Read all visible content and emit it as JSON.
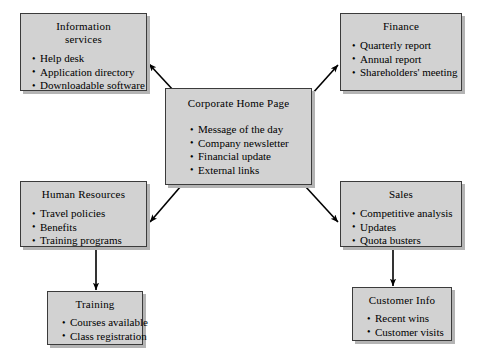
{
  "diagram": {
    "style": {
      "node_fill": "#d2d2d2",
      "node_border": "#3b3b3b",
      "node_shadow": "#b4b4b4",
      "arrow_color": "#000000",
      "background": "#ffffff"
    },
    "nodes": [
      {
        "id": "information-services",
        "title": "Information\nservices",
        "items": [
          "Help desk",
          "Application directory",
          "Downloadable software"
        ]
      },
      {
        "id": "finance",
        "title": "Finance",
        "items": [
          "Quarterly report",
          "Annual report",
          "Shareholders' meeting"
        ]
      },
      {
        "id": "center",
        "title": "Corporate Home Page",
        "items": [
          "Message of the day",
          "Company newsletter",
          "Financial update",
          "External links"
        ]
      },
      {
        "id": "human-resources",
        "title": "Human Resources",
        "items": [
          "Travel policies",
          "Benefits",
          "Training programs"
        ]
      },
      {
        "id": "sales",
        "title": "Sales",
        "items": [
          "Competitive analysis",
          "Updates",
          "Quota busters"
        ]
      },
      {
        "id": "training",
        "title": "Training",
        "items": [
          "Courses available",
          "Class registration"
        ]
      },
      {
        "id": "customer-info",
        "title": "Customer Info",
        "items": [
          "Recent wins",
          "Customer visits"
        ]
      }
    ],
    "connectors": [
      {
        "id": "center-to-information-services",
        "from": "center",
        "to": "information-services",
        "kind": "diagonal-arrow"
      },
      {
        "id": "center-to-finance",
        "from": "center",
        "to": "finance",
        "kind": "diagonal-arrow"
      },
      {
        "id": "center-to-human-resources",
        "from": "center",
        "to": "human-resources",
        "kind": "diagonal-arrow"
      },
      {
        "id": "center-to-sales",
        "from": "center",
        "to": "sales",
        "kind": "diagonal-arrow"
      },
      {
        "id": "human-resources-to-training",
        "from": "human-resources",
        "to": "training",
        "kind": "vertical-arrow"
      },
      {
        "id": "sales-to-customer-info",
        "from": "sales",
        "to": "customer-info",
        "kind": "vertical-arrow"
      }
    ]
  }
}
